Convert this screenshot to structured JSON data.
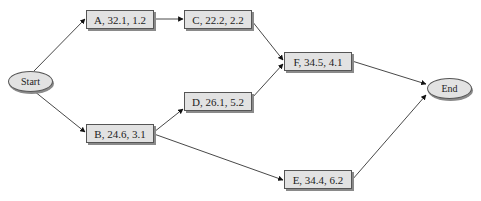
{
  "diagram": {
    "type": "network-diagram",
    "nodes": [
      {
        "id": "start",
        "label": "Start",
        "shape": "ellipse"
      },
      {
        "id": "A",
        "label": "A, 32.1, 1.2",
        "shape": "box"
      },
      {
        "id": "B",
        "label": "B, 24.6, 3.1",
        "shape": "box"
      },
      {
        "id": "C",
        "label": "C, 22.2, 2.2",
        "shape": "box"
      },
      {
        "id": "D",
        "label": "D, 26.1, 5.2",
        "shape": "box"
      },
      {
        "id": "E",
        "label": "E, 34.4, 6.2",
        "shape": "box"
      },
      {
        "id": "F",
        "label": "F, 34.5, 4.1",
        "shape": "box"
      },
      {
        "id": "end",
        "label": "End",
        "shape": "ellipse"
      }
    ],
    "edges": [
      {
        "from": "start",
        "to": "A"
      },
      {
        "from": "start",
        "to": "B"
      },
      {
        "from": "A",
        "to": "C"
      },
      {
        "from": "B",
        "to": "D"
      },
      {
        "from": "B",
        "to": "E"
      },
      {
        "from": "C",
        "to": "F"
      },
      {
        "from": "D",
        "to": "F"
      },
      {
        "from": "F",
        "to": "end"
      },
      {
        "from": "E",
        "to": "end"
      }
    ]
  }
}
